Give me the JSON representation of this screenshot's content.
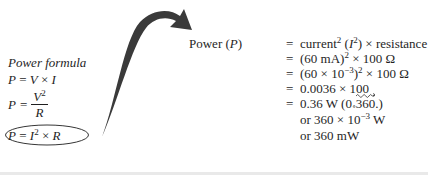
{
  "left_panel": {
    "title": "Power formula",
    "formula_1": {
      "lhs": "P",
      "eq": "=",
      "a": "V",
      "op": "×",
      "b": "I"
    },
    "formula_2": {
      "lhs": "P",
      "eq": "=",
      "numerator": "V",
      "num_exp": "2",
      "denominator": "R"
    },
    "formula_3": {
      "lhs": "P",
      "eq": "=",
      "a": "I",
      "a_exp": "2",
      "op": "×",
      "b": "R",
      "highlighted": true
    }
  },
  "calculation": {
    "lhs_text": "Power (",
    "lhs_var": "P",
    "lhs_close": ")",
    "steps": [
      {
        "eq": "=",
        "parts": [
          "current",
          "2",
          " (",
          "I",
          "2",
          ") × resistance"
        ]
      },
      {
        "eq": "=",
        "parts": [
          "(60 mA)",
          "2",
          " × 100 Ω"
        ]
      },
      {
        "eq": "=",
        "parts": [
          "(60 × 10",
          "−3",
          ")",
          "2",
          " × 100 Ω"
        ]
      },
      {
        "eq": "=",
        "parts": [
          "0.0036 × 100"
        ]
      },
      {
        "eq": "=",
        "parts": [
          "0.36 W (0",
          "∘",
          "360",
          ".)"
        ]
      }
    ],
    "alternates": [
      {
        "parts": [
          "or 360 × 10",
          "−3",
          " W"
        ]
      },
      {
        "parts": [
          "or 360 mW"
        ]
      }
    ]
  },
  "colors": {
    "ink": "#1f1f1f",
    "arrow": "#3a3a3a",
    "background": "#ffffff"
  }
}
